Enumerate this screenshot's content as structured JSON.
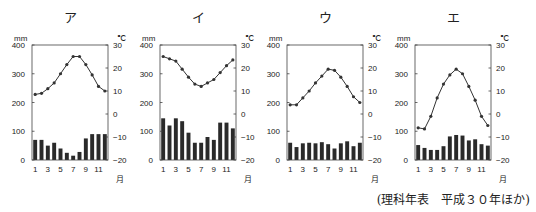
{
  "source_note": "(理科年表　平成３０年ほか)",
  "axes": {
    "left_unit": "mm",
    "right_unit": "℃",
    "month_unit": "月",
    "left_ticks": [
      400,
      300,
      200,
      100,
      0
    ],
    "right_ticks": [
      30,
      20,
      10,
      0,
      -10,
      -20
    ],
    "month_ticks": [
      1,
      3,
      5,
      7,
      9,
      11
    ]
  },
  "chart_data": [
    {
      "type": "bar+line",
      "title": "ア",
      "categories": [
        1,
        2,
        3,
        4,
        5,
        6,
        7,
        8,
        9,
        10,
        11,
        12
      ],
      "xlabel": "月",
      "ylabel_left": "mm",
      "ylim_left": [
        0,
        400
      ],
      "ylabel_right": "℃",
      "ylim_right": [
        -20,
        30
      ],
      "series": [
        {
          "name": "precipitation",
          "axis": "left",
          "kind": "bar",
          "values": [
            70,
            70,
            50,
            60,
            40,
            25,
            15,
            28,
            75,
            90,
            90,
            90
          ]
        },
        {
          "name": "temperature",
          "axis": "right",
          "kind": "line",
          "values": [
            8.5,
            9,
            11,
            13.5,
            17.5,
            21.5,
            25,
            25,
            21.5,
            17,
            12,
            10
          ]
        }
      ]
    },
    {
      "type": "bar+line",
      "title": "イ",
      "categories": [
        1,
        2,
        3,
        4,
        5,
        6,
        7,
        8,
        9,
        10,
        11,
        12
      ],
      "xlabel": "月",
      "ylabel_left": "mm",
      "ylim_left": [
        0,
        400
      ],
      "ylabel_right": "℃",
      "ylim_right": [
        -20,
        30
      ],
      "series": [
        {
          "name": "precipitation",
          "axis": "left",
          "kind": "bar",
          "values": [
            145,
            120,
            145,
            135,
            95,
            60,
            60,
            80,
            70,
            130,
            130,
            110
          ]
        },
        {
          "name": "temperature",
          "axis": "right",
          "kind": "line",
          "values": [
            25,
            24,
            23,
            19.5,
            16,
            13,
            12,
            13.5,
            15,
            18,
            21,
            23.5
          ]
        }
      ]
    },
    {
      "type": "bar+line",
      "title": "ウ",
      "categories": [
        1,
        2,
        3,
        4,
        5,
        6,
        7,
        8,
        9,
        10,
        11,
        12
      ],
      "xlabel": "月",
      "ylabel_left": "mm",
      "ylim_left": [
        0,
        400
      ],
      "ylabel_right": "℃",
      "ylim_right": [
        -20,
        30
      ],
      "series": [
        {
          "name": "precipitation",
          "axis": "left",
          "kind": "bar",
          "values": [
            60,
            45,
            58,
            60,
            58,
            62,
            55,
            40,
            58,
            65,
            48,
            60
          ]
        },
        {
          "name": "temperature",
          "axis": "right",
          "kind": "line",
          "values": [
            4,
            4,
            7,
            10,
            13.5,
            16.5,
            19.5,
            19,
            16,
            12,
            7.5,
            5
          ]
        }
      ]
    },
    {
      "type": "bar+line",
      "title": "エ",
      "categories": [
        1,
        2,
        3,
        4,
        5,
        6,
        7,
        8,
        9,
        10,
        11,
        12
      ],
      "xlabel": "月",
      "ylabel_left": "mm",
      "ylim_left": [
        0,
        400
      ],
      "ylabel_right": "℃",
      "ylim_right": [
        -20,
        30
      ],
      "series": [
        {
          "name": "precipitation",
          "axis": "left",
          "kind": "bar",
          "values": [
            52,
            42,
            35,
            35,
            48,
            82,
            87,
            85,
            68,
            72,
            55,
            50
          ]
        },
        {
          "name": "temperature",
          "axis": "right",
          "kind": "line",
          "values": [
            -6,
            -6.5,
            -1,
            7,
            13,
            17,
            19.5,
            17.5,
            12,
            6,
            -1,
            -5
          ]
        }
      ]
    }
  ],
  "colors": {
    "bar": "#2a2a2a",
    "line": "#333333",
    "frame": "#444444",
    "text": "#222222"
  },
  "layout": {
    "frames_x": [
      32,
      160,
      287,
      415
    ],
    "frame_width": 76,
    "frame_top": 45,
    "frame_bottom": 160
  }
}
